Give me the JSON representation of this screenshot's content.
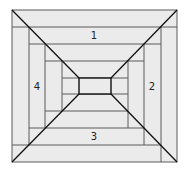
{
  "diagram": {
    "type": "log-cabin spiral / perspective tunnel",
    "colors": {
      "fill": "#ebebeb",
      "grid_line": "#5a5a5a",
      "diagonal": "#111111",
      "inner_rect": "#111111",
      "label": "#222222"
    },
    "labels": [
      {
        "id": "panel-1",
        "text": "1",
        "x": 94,
        "y": 39
      },
      {
        "id": "panel-2",
        "text": "2",
        "x": 152,
        "y": 90
      },
      {
        "id": "panel-3",
        "text": "3",
        "x": 94,
        "y": 140
      },
      {
        "id": "panel-4",
        "text": "4",
        "x": 37,
        "y": 90
      }
    ]
  }
}
